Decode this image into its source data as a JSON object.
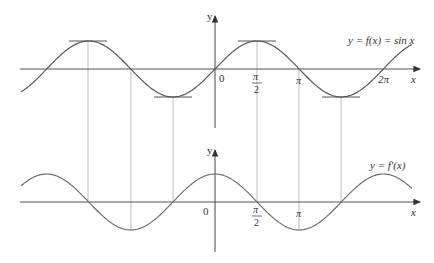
{
  "figure": {
    "top_graph": {
      "function_label": "y = f(x) = sin x",
      "y_axis_label": "y",
      "x_axis_label": "x",
      "tick_labels": [
        "0",
        "π",
        "2",
        "π",
        "2π"
      ],
      "origin_label": "0",
      "pi_half_num": "π",
      "pi_half_den": "2",
      "pi_label": "π",
      "two_pi_label": "2π"
    },
    "bottom_graph": {
      "function_label": "y = f′(x)",
      "y_axis_label": "y",
      "x_axis_label": "x",
      "origin_label": "0",
      "pi_half_num": "π",
      "pi_half_den": "2",
      "pi_label": "π"
    },
    "colors": {
      "curve": "#555555",
      "axis": "#555555",
      "guide": "#bbbbbb",
      "text": "#333333"
    }
  },
  "chart_data": [
    {
      "type": "line",
      "title": "y = f(x) = sin x",
      "xlabel": "x",
      "ylabel": "y",
      "x_ticks": [
        "0",
        "π/2",
        "π",
        "2π"
      ],
      "x_range": [
        -7.2,
        7.2
      ],
      "y_range": [
        -1,
        1
      ],
      "series": [
        {
          "name": "sin x",
          "function": "sin(x)"
        }
      ],
      "horizontal_tangents_at": [
        "-3π/2",
        "-π/2",
        "π/2",
        "3π/2"
      ]
    },
    {
      "type": "line",
      "title": "y = f′(x)",
      "xlabel": "x",
      "ylabel": "y",
      "x_ticks": [
        "0",
        "π/2",
        "π"
      ],
      "x_range": [
        -7.2,
        7.2
      ],
      "y_range": [
        -1,
        1
      ],
      "series": [
        {
          "name": "f′(x) = cos x",
          "function": "cos(x)"
        }
      ],
      "zeros_at": [
        "-3π/2",
        "-π/2",
        "π/2",
        "3π/2"
      ]
    }
  ]
}
